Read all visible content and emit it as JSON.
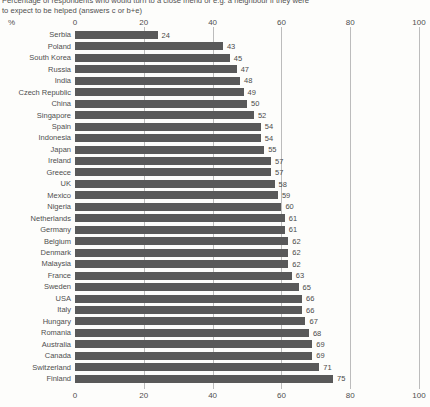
{
  "title": {
    "line1": "Percentage of respondents who would turn to a close friend or e.g. a neighbour if they were",
    "line2": "to expect to be helped (answers c or b+e)"
  },
  "axis": {
    "percent_symbol": "%"
  },
  "chart_data": {
    "type": "bar",
    "orientation": "horizontal",
    "title": "Percentage of respondents who would turn to a close friend or e.g. a neighbour if they were to expect to be helped (answers c or b+e)",
    "xlabel": "%",
    "ylabel": "",
    "xlim": [
      0,
      100
    ],
    "x_ticks": [
      0,
      20,
      40,
      60,
      80,
      100
    ],
    "grid": true,
    "legend": false,
    "value_labels": true,
    "categories": [
      "Serbia",
      "Poland",
      "South Korea",
      "Russia",
      "India",
      "Czech Republic",
      "China",
      "Singapore",
      "Spain",
      "Indonesia",
      "Japan",
      "Ireland",
      "Greece",
      "UK",
      "Mexico",
      "Nigeria",
      "Netherlands",
      "Germany",
      "Belgium",
      "Denmark",
      "Malaysia",
      "France",
      "Sweden",
      "USA",
      "Italy",
      "Hungary",
      "Romania",
      "Australia",
      "Canada",
      "Switzerland",
      "Finland"
    ],
    "values": [
      24,
      43,
      45,
      47,
      48,
      49,
      50,
      52,
      54,
      54,
      55,
      57,
      57,
      58,
      59,
      60,
      61,
      61,
      62,
      62,
      62,
      63,
      65,
      66,
      66,
      67,
      68,
      69,
      69,
      71,
      75
    ],
    "colors": {
      "bar": "#595959",
      "grid": "#bcbcbc",
      "text": "#4f4f4f",
      "background": "#fdfdfb"
    }
  }
}
